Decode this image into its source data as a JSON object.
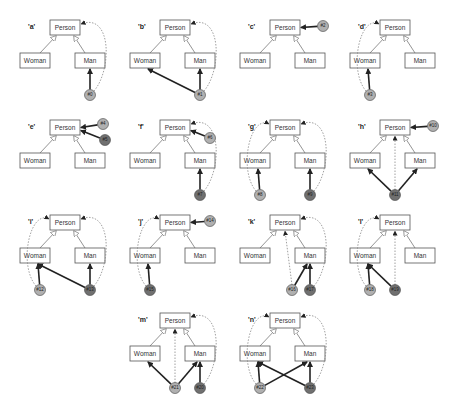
{
  "nodes": {
    "person": "Person",
    "woman": "Woman",
    "man": "Man"
  },
  "panels": [
    {
      "label": "'a'",
      "instances": [
        {
          "id": "#0",
          "shade": "light"
        }
      ]
    },
    {
      "label": "'b'",
      "instances": [
        {
          "id": "#1",
          "shade": "light"
        }
      ]
    },
    {
      "label": "'c'",
      "instances": [
        {
          "id": "#2",
          "shade": "light"
        }
      ]
    },
    {
      "label": "'d'",
      "instances": [
        {
          "id": "#3",
          "shade": "light"
        }
      ]
    },
    {
      "label": "'e'",
      "instances": [
        {
          "id": "#4",
          "shade": "light"
        },
        {
          "id": "#5",
          "shade": "dark"
        }
      ]
    },
    {
      "label": "'f'",
      "instances": [
        {
          "id": "#6",
          "shade": "light"
        },
        {
          "id": "#7",
          "shade": "dark"
        }
      ]
    },
    {
      "label": "'g'",
      "instances": [
        {
          "id": "#8",
          "shade": "light"
        },
        {
          "id": "#9",
          "shade": "dark"
        }
      ]
    },
    {
      "label": "'h'",
      "instances": [
        {
          "id": "#10",
          "shade": "light"
        },
        {
          "id": "#11",
          "shade": "dark"
        }
      ]
    },
    {
      "label": "'i'",
      "instances": [
        {
          "id": "#12",
          "shade": "light"
        },
        {
          "id": "#13",
          "shade": "dark"
        }
      ]
    },
    {
      "label": "'j'",
      "instances": [
        {
          "id": "#14",
          "shade": "light"
        },
        {
          "id": "#15",
          "shade": "dark"
        }
      ]
    },
    {
      "label": "'k'",
      "instances": [
        {
          "id": "#16",
          "shade": "light"
        },
        {
          "id": "#17",
          "shade": "dark"
        }
      ]
    },
    {
      "label": "'l'",
      "instances": [
        {
          "id": "#18",
          "shade": "light"
        },
        {
          "id": "#19",
          "shade": "dark"
        }
      ]
    },
    {
      "label": "'m'",
      "instances": [
        {
          "id": "#21",
          "shade": "light"
        },
        {
          "id": "#20",
          "shade": "dark"
        }
      ]
    },
    {
      "label": "'n'",
      "instances": [
        {
          "id": "#22",
          "shade": "light"
        },
        {
          "id": "#23",
          "shade": "dark"
        }
      ]
    }
  ],
  "colors": {
    "light": "#b0b0b0",
    "dark": "#707070",
    "stroke": "#444444"
  }
}
